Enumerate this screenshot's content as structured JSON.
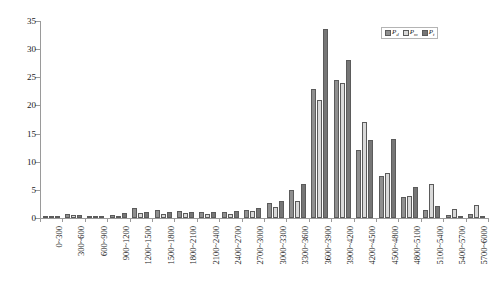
{
  "chart_data": {
    "type": "bar",
    "title": "",
    "xlabel": "",
    "ylabel": "",
    "ylim": [
      0,
      35
    ],
    "ytick_values": [
      0,
      5,
      10,
      15,
      20,
      25,
      30,
      35
    ],
    "ytick_labels": [
      "0",
      "5",
      "10",
      "15",
      "20",
      "25",
      "30",
      "35"
    ],
    "grid": false,
    "legend_position": "top-right",
    "categories": [
      "0~300",
      "300~600",
      "600~900",
      "900~1200",
      "1200~1500",
      "1500~1800",
      "1800~2100",
      "2100~2400",
      "2400~2700",
      "2700~3000",
      "3000~3300",
      "3300~3600",
      "3600~3900",
      "3900~4200",
      "4200~4500",
      "4500~4800",
      "4800~5100",
      "5100~5400",
      "5400~5700",
      "5700~6000"
    ],
    "series": [
      {
        "name": "Pd",
        "label_base": "P",
        "label_sub": "d",
        "color": "#8f8f8f",
        "values": [
          0.3,
          0.7,
          0.2,
          0.6,
          1.8,
          1.5,
          1.2,
          1.0,
          1.1,
          1.5,
          2.6,
          5.0,
          23.0,
          24.5,
          12.0,
          7.5,
          3.7,
          1.5,
          0.6,
          0.8
        ]
      },
      {
        "name": "Pm",
        "label_base": "P",
        "label_sub": "m",
        "color": "#d9d9d9",
        "values": [
          0.2,
          0.5,
          0.2,
          0.4,
          0.9,
          0.7,
          0.9,
          0.7,
          0.8,
          1.2,
          2.0,
          3.1,
          21.0,
          24.0,
          17.0,
          8.0,
          4.0,
          6.0,
          1.6,
          2.3
        ]
      },
      {
        "name": "Pt",
        "label_base": "P",
        "label_sub": "t",
        "color": "#767676",
        "values": [
          0.2,
          0.6,
          0.4,
          0.9,
          1.0,
          1.1,
          1.0,
          1.0,
          1.3,
          1.7,
          3.0,
          6.0,
          33.5,
          28.0,
          13.9,
          14.0,
          5.5,
          2.2,
          0.4,
          0.3
        ]
      }
    ]
  },
  "legend": {
    "entries": [
      "Pd",
      "Pm",
      "Pt"
    ]
  }
}
